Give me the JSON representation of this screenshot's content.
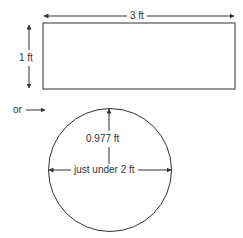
{
  "diagram": {
    "rectangle": {
      "width_label": "3 ft",
      "height_label": "1 ft"
    },
    "connector": {
      "label": "or"
    },
    "circle": {
      "radius_label": "0.977 ft",
      "diameter_label": "just under 2 ft"
    },
    "colors": {
      "stroke": "#333333",
      "background": "#ffffff"
    }
  }
}
